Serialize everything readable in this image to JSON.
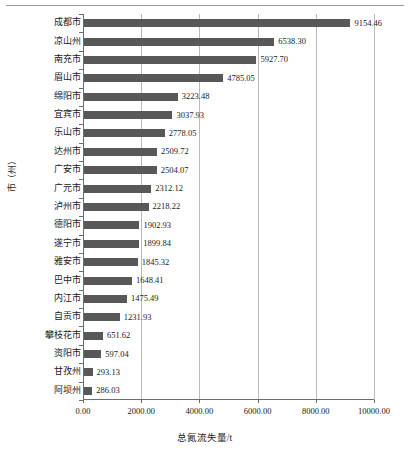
{
  "chart_data": {
    "type": "bar",
    "orientation": "horizontal",
    "title": "",
    "xlabel": "总氮流失量/t",
    "ylabel": "市（州）",
    "xlim": [
      0,
      10000
    ],
    "xticks": [
      "0.00",
      "2000.00",
      "4000.00",
      "6000.00",
      "8000.00",
      "10000.00"
    ],
    "xtick_values": [
      0,
      2000,
      4000,
      6000,
      8000,
      10000
    ],
    "grid": "vertical",
    "legend": "none",
    "bar_color": "#585858",
    "categories": [
      "成都市",
      "凉山州",
      "南充市",
      "眉山市",
      "绵阳市",
      "宜宾市",
      "乐山市",
      "达州市",
      "广安市",
      "广元市",
      "泸州市",
      "德阳市",
      "遂宁市",
      "雅安市",
      "巴中市",
      "内江市",
      "自贡市",
      "攀枝花市",
      "资阳市",
      "甘孜州",
      "阿坝州"
    ],
    "values": [
      9154.46,
      6538.3,
      5927.7,
      4785.05,
      3223.48,
      3037.93,
      2778.05,
      2509.72,
      2504.07,
      2312.12,
      2218.22,
      1902.93,
      1899.84,
      1845.32,
      1648.41,
      1475.49,
      1231.93,
      651.62,
      597.04,
      293.13,
      286.03
    ],
    "value_labels": [
      "9154.46",
      "6538.30",
      "5927.70",
      "4785.05",
      "3223.48",
      "3037.93",
      "2778.05",
      "2509.72",
      "2504.07",
      "2312.12",
      "2218.22",
      "1902.93",
      "1899.84",
      "1845.32",
      "1648.41",
      "1475.49",
      "1231.93",
      "651.62",
      "597.04",
      "293.13",
      "286.03"
    ]
  }
}
